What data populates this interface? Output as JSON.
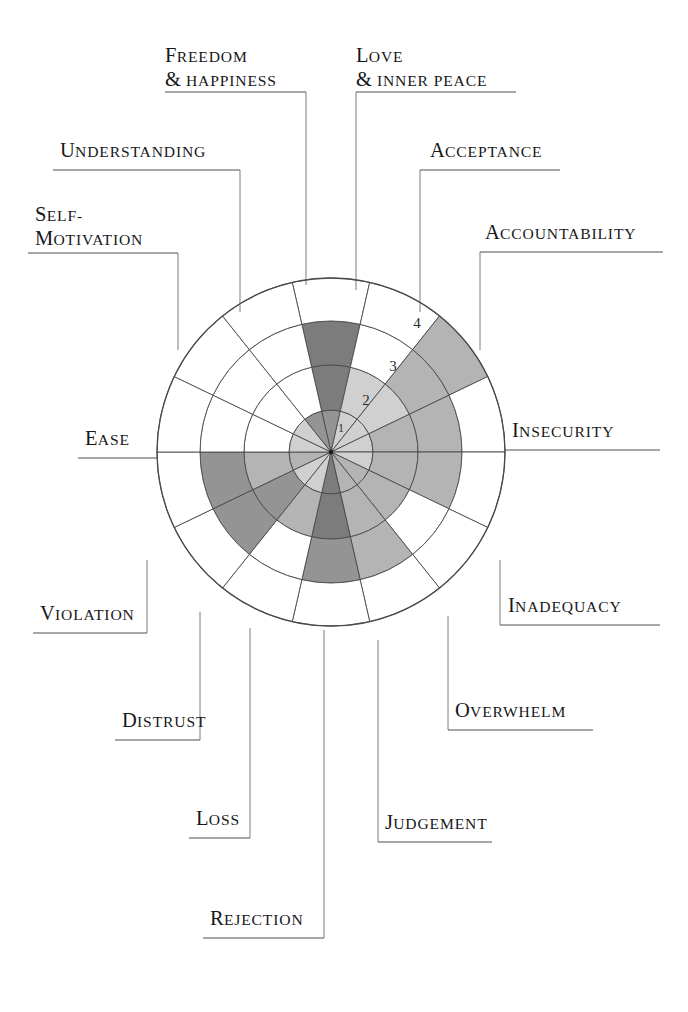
{
  "figure": {
    "type": "radial-wheel-diagram",
    "title_visible": false,
    "center": {
      "x": 331,
      "y": 452
    },
    "outer_radius": 174,
    "ring_count": 4,
    "spoke_count": 14,
    "ring_radii": [
      42,
      87,
      131,
      174
    ],
    "ring_labels": [
      {
        "text": "1",
        "x": 341,
        "y": 432
      },
      {
        "text": "2",
        "x": 366,
        "y": 405
      },
      {
        "text": "3",
        "x": 393,
        "y": 371
      },
      {
        "text": "4",
        "x": 417,
        "y": 328
      }
    ],
    "colors": {
      "ink": "#1c1c1c",
      "stroke": "#4a4a4a",
      "paper": "#ffffff",
      "fill_empty": "#ffffff",
      "fill_light": "#d0d0d0",
      "fill_mid": "#b4b4b4",
      "fill_dark": "#949494",
      "fill_darkest": "#7c7c7c"
    }
  },
  "chart_data": {
    "type": "radar",
    "title": "",
    "subtitle": "",
    "xlabel": "",
    "ylabel": "",
    "scale_min": 0,
    "scale_max": 4,
    "ring_tick_labels": [
      "1",
      "2",
      "3",
      "4"
    ],
    "grid": true,
    "legend_position": "none",
    "categories": [
      "Freedom & Happiness",
      "Love & Inner Peace",
      "Acceptance",
      "Accountability",
      "Insecurity",
      "Inadequacy",
      "Overwhelm",
      "Judgement",
      "Rejection",
      "Loss",
      "Distrust",
      "Violation",
      "Ease",
      "Understanding"
    ],
    "values": [
      3,
      2,
      4,
      3,
      3,
      2,
      3,
      3,
      2,
      3,
      3,
      1,
      1,
      1
    ],
    "series": [
      {
        "name": "Wheel rating",
        "values": [
          3,
          2,
          4,
          3,
          3,
          2,
          3,
          3,
          2,
          3,
          3,
          1,
          1,
          1
        ]
      }
    ]
  },
  "labels": [
    {
      "id": "freedom-happiness",
      "line1_cap": "F",
      "line1_rest": "REEDOM",
      "line2_cap": "&",
      "line2_rest": " HAPPINESS",
      "two_line": true,
      "text": "Freedom & Happiness"
    },
    {
      "id": "love-inner-peace",
      "line1_cap": "L",
      "line1_rest": "OVE",
      "line2_cap": "&",
      "line2_rest": " INNER PEACE",
      "two_line": true,
      "text": "Love & Inner Peace"
    },
    {
      "id": "acceptance",
      "line1_cap": "A",
      "line1_rest": "CCEPTANCE",
      "two_line": false,
      "text": "Acceptance"
    },
    {
      "id": "accountability",
      "line1_cap": "A",
      "line1_rest": "CCOUNTABILITY",
      "two_line": false,
      "text": "Accountability"
    },
    {
      "id": "insecurity",
      "line1_cap": "I",
      "line1_rest": "NSECURITY",
      "two_line": false,
      "text": "Insecurity"
    },
    {
      "id": "inadequacy",
      "line1_cap": "I",
      "line1_rest": "NADEQUACY",
      "two_line": false,
      "text": "Inadequacy"
    },
    {
      "id": "overwhelm",
      "line1_cap": "O",
      "line1_rest": "VERWHELM",
      "two_line": false,
      "text": "Overwhelm"
    },
    {
      "id": "judgement",
      "line1_cap": "J",
      "line1_rest": "UDGEMENT",
      "two_line": false,
      "text": "Judgement"
    },
    {
      "id": "rejection",
      "line1_cap": "R",
      "line1_rest": "EJECTION",
      "two_line": false,
      "text": "Rejection"
    },
    {
      "id": "loss",
      "line1_cap": "L",
      "line1_rest": "OSS",
      "two_line": false,
      "text": "Loss"
    },
    {
      "id": "distrust",
      "line1_cap": "D",
      "line1_rest": "ISTRUST",
      "two_line": false,
      "text": "Distrust"
    },
    {
      "id": "violation",
      "line1_cap": "V",
      "line1_rest": "IOLATION",
      "two_line": false,
      "text": "Violation"
    },
    {
      "id": "ease",
      "line1_cap": "E",
      "line1_rest": "ASE",
      "two_line": false,
      "text": "Ease"
    },
    {
      "id": "self-motivation",
      "line1_cap": "S",
      "line1_rest": "ELF-",
      "line2_cap": "M",
      "line2_rest": "OTIVATION",
      "two_line": true,
      "text": "Self-Motivation"
    },
    {
      "id": "understanding",
      "line1_cap": "U",
      "line1_rest": "NDERSTANDING",
      "two_line": false,
      "text": "Understanding"
    }
  ]
}
